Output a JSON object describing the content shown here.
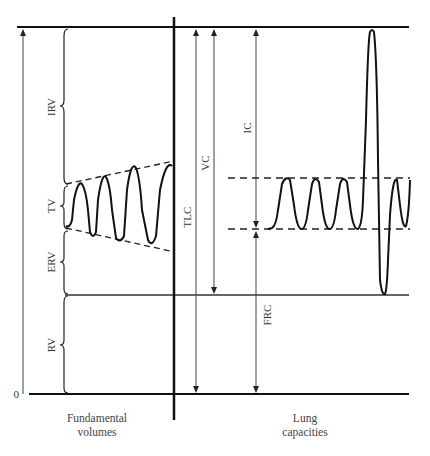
{
  "diagram": {
    "zero_label": "0",
    "left_caption": [
      "Fundamental",
      "volumes"
    ],
    "right_caption": [
      "Lung",
      "capacities"
    ],
    "volumes": [
      {
        "key": "IRV",
        "label": "IRV"
      },
      {
        "key": "TV",
        "label": "TV"
      },
      {
        "key": "ERV",
        "label": "ERV"
      },
      {
        "key": "RV",
        "label": "RV"
      }
    ],
    "capacities": [
      {
        "key": "TLC",
        "label": "TLC"
      },
      {
        "key": "VC",
        "label": "VC"
      },
      {
        "key": "IC",
        "label": "IC"
      },
      {
        "key": "FRC",
        "label": "FRC"
      }
    ],
    "colors": {
      "line": "#111111",
      "thin": "#444444"
    }
  }
}
